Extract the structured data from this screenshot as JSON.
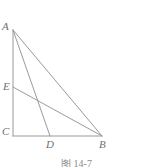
{
  "figure": {
    "type": "geometry-diagram",
    "caption": "图 14-7",
    "stroke_color": "#9a9a9a",
    "label_color": "#6f6f6f",
    "background_color": "#ffffff",
    "stroke_width": 1,
    "points": {
      "A": {
        "label": "A",
        "x": 13,
        "y": 30
      },
      "B": {
        "label": "B",
        "x": 102,
        "y": 136
      },
      "C": {
        "label": "C",
        "x": 13,
        "y": 136
      },
      "D": {
        "label": "D",
        "x": 50,
        "y": 136
      },
      "E": {
        "label": "E",
        "x": 13,
        "y": 87
      }
    },
    "segments": [
      {
        "name": "AC",
        "from": "A",
        "to": "C"
      },
      {
        "name": "CB",
        "from": "C",
        "to": "B"
      },
      {
        "name": "AB",
        "from": "A",
        "to": "B"
      },
      {
        "name": "AD",
        "from": "A",
        "to": "D"
      },
      {
        "name": "EB",
        "from": "E",
        "to": "B"
      }
    ]
  }
}
